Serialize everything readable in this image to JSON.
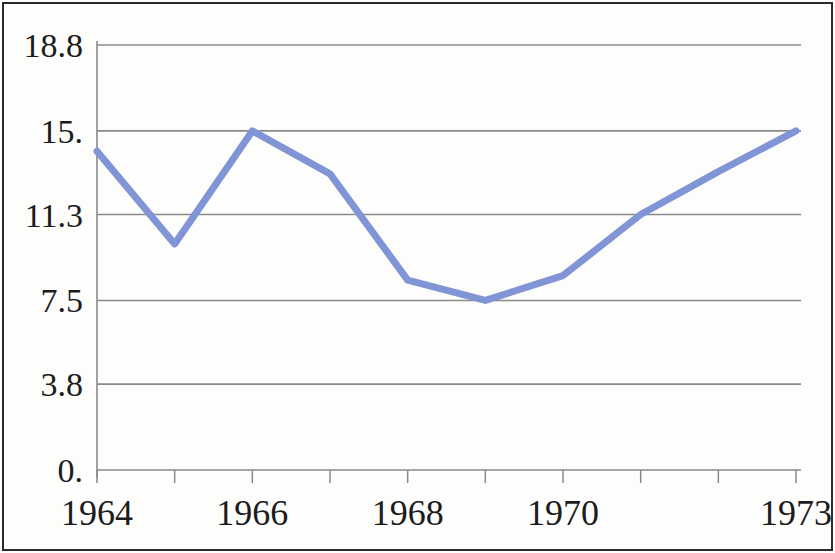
{
  "chart_data": {
    "type": "line",
    "title": "",
    "subtitle": "",
    "xlabel": "",
    "ylabel": "",
    "legend": [],
    "legend_position": "none",
    "grid": "horizontal",
    "x": [
      1964,
      1965,
      1966,
      1967,
      1968,
      1969,
      1970,
      1971,
      1972,
      1973
    ],
    "values": [
      14.1,
      10.0,
      15.0,
      13.1,
      8.4,
      7.5,
      8.6,
      11.3,
      13.2,
      15.0
    ],
    "series": [
      {
        "name": "series-1",
        "color": "#8094d6",
        "values": [
          14.1,
          10.0,
          15.0,
          13.1,
          8.4,
          7.5,
          8.6,
          11.3,
          13.2,
          15.0
        ]
      }
    ],
    "xlim": [
      1964,
      1973
    ],
    "ylim": [
      0,
      18.8
    ],
    "x_tick_values": [
      1964,
      1965,
      1966,
      1967,
      1968,
      1969,
      1970,
      1971,
      1972,
      1973
    ],
    "x_tick_labels_shown": [
      "1964",
      "1966",
      "1968",
      "1970",
      "1973"
    ],
    "x_tick_label_positions": [
      1964,
      1966,
      1968,
      1970,
      1973
    ],
    "y_tick_values": [
      0,
      3.8,
      7.5,
      11.3,
      15.0,
      18.8
    ],
    "y_tick_labels": [
      "0.",
      "3.8",
      "7.5",
      "11.3",
      "15.",
      "18.8"
    ],
    "line_color": "#8094d6",
    "grid_color": "#8a8a8a",
    "axis_color": "#8a8a8a",
    "text_color": "#1c1c1c",
    "background_color": "#fdfdfc",
    "border_color": "#2b2b2b"
  }
}
